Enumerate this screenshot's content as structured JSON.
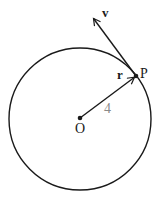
{
  "diagram": {
    "title": "",
    "circle": {
      "center_label": "O",
      "radius_value": "4"
    },
    "points": {
      "center": "O",
      "on_circle": "P"
    },
    "vectors": {
      "position": "r",
      "velocity": "v"
    },
    "colors": {
      "stroke": "#1a1a1a",
      "radius_label": "#8a8a8a",
      "background": "#ffffff"
    }
  }
}
